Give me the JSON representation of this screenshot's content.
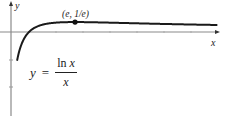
{
  "chart_data": {
    "type": "line",
    "title": "",
    "function": "y = ln x / x",
    "xlabel": "x",
    "ylabel": "y",
    "grid": false,
    "legend": null,
    "xlim": [
      -0.35,
      7.8
    ],
    "ylim": [
      -3.0,
      1.15
    ],
    "series": [
      {
        "name": "y = ln x / x",
        "x": [
          0.35,
          0.4,
          0.5,
          0.6,
          0.7,
          0.8,
          0.9,
          1.0,
          1.2,
          1.5,
          2.0,
          2.5,
          2.718,
          3.0,
          4.0,
          5.0,
          6.0,
          7.0,
          7.75
        ],
        "values": [
          -3.0,
          -2.291,
          -1.386,
          -0.851,
          -0.51,
          -0.279,
          -0.117,
          0.0,
          0.152,
          0.27,
          0.347,
          0.367,
          0.368,
          0.366,
          0.347,
          0.322,
          0.299,
          0.278,
          0.264
        ]
      }
    ],
    "annotations": [
      {
        "text": "(e, 1/e)",
        "x": 2.718,
        "y": 0.368,
        "marker": "dot"
      },
      {
        "text": "y = ln x / x",
        "role": "curve-label"
      }
    ],
    "colors": {
      "curve": "#1a1a1a",
      "axes": "#8a8a8a",
      "text": "#222222"
    }
  },
  "labels": {
    "y_axis": "y",
    "x_axis": "x",
    "point": "(e, 1/e)",
    "formula_lhs": "y",
    "formula_eq": "=",
    "formula_num_fn": "ln ",
    "formula_num_var": "x",
    "formula_den": "x"
  }
}
